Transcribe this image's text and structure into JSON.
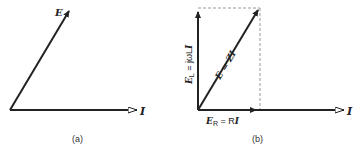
{
  "figure_a": {
    "caption": "(a)",
    "vector_E_label": "E",
    "vector_I_label": "I"
  },
  "figure_b": {
    "caption": "(b)",
    "vector_I_label": "I",
    "vector_EL_sym": "E",
    "vector_EL_sub": "L",
    "vector_EL_rhs": " = jωL",
    "vector_EL_I": "I",
    "vector_E_label": "E = ZI",
    "vector_ER_sym": "E",
    "vector_ER_sub": "R",
    "vector_ER_rhs": " = R",
    "vector_ER_I": "I"
  },
  "colors": {
    "line": "#222222",
    "dashed": "#999999"
  }
}
